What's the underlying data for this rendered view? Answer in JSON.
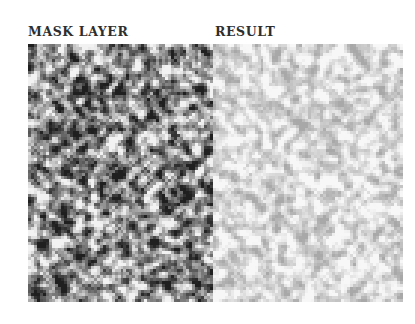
{
  "labels": {
    "mask_layer": "MASK LAYER",
    "result": "RESULT"
  },
  "panels": {
    "mask": {
      "description": "dense grayscale noise texture (dark/white speckle)",
      "dark_color": "#1f1f1f",
      "light_color": "#f2f2f2"
    },
    "result": {
      "description": "light grayscale noise texture (pale gray/white speckle)",
      "dark_color": "#a8a8a8",
      "light_color": "#f7f7f7"
    }
  }
}
